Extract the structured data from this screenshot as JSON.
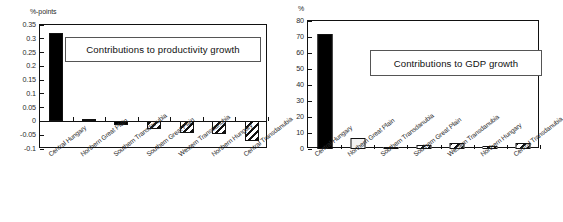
{
  "figure": {
    "background": "#ffffff",
    "panel_count": 2
  },
  "chart_data": [
    {
      "type": "bar",
      "id": "productivity",
      "title": "Contributions to productivity growth",
      "xlabel": "",
      "ylabel": "%-points",
      "unit_label": "%-points",
      "ylim": [
        -0.1,
        0.35
      ],
      "ytick_step": 0.05,
      "yticks": [
        0.35,
        0.3,
        0.25,
        0.2,
        0.15,
        0.1,
        0.05,
        0,
        -0.05,
        -0.1
      ],
      "ytick_labels": [
        "0.35",
        "0.3",
        "0.25",
        "0.2",
        "0.15",
        "0.1",
        "0.05",
        "0",
        "-0.05",
        "-0.1"
      ],
      "grid": false,
      "legend": "none",
      "categories": [
        "Central Hungary",
        "Northern Great Plain",
        "Southern Transdanubia",
        "Southern Great Plain",
        "Western Transdanubia",
        "Northern Hungary",
        "Central Transdanubia"
      ],
      "values": [
        0.32,
        0.008,
        -0.012,
        -0.028,
        -0.042,
        -0.045,
        -0.07
      ],
      "fills": [
        "solid",
        "open",
        "solid",
        "hatch",
        "hatch",
        "hatch",
        "hatch"
      ]
    },
    {
      "type": "bar",
      "id": "gdp",
      "title": "Contributions to GDP growth",
      "xlabel": "",
      "ylabel": "%",
      "unit_label": "%",
      "ylim": [
        0,
        80
      ],
      "ytick_step": 10,
      "yticks": [
        80,
        70,
        60,
        50,
        40,
        30,
        20,
        10,
        0
      ],
      "ytick_labels": [
        "80",
        "70",
        "60",
        "50",
        "40",
        "30",
        "20",
        "10",
        "0"
      ],
      "grid": false,
      "legend": "none",
      "categories": [
        "Central Hungary",
        "Northern Great Plain",
        "Southern Transdanubia",
        "Southern Great Plain",
        "Western Transdanubia",
        "Northern Hungary",
        "Central Transdanubia"
      ],
      "values": [
        72,
        7,
        1.5,
        2.5,
        4,
        1.8,
        3.8
      ],
      "fills": [
        "solid",
        "open",
        "hatch",
        "hatch",
        "hatch",
        "hatch",
        "hatch"
      ]
    }
  ]
}
